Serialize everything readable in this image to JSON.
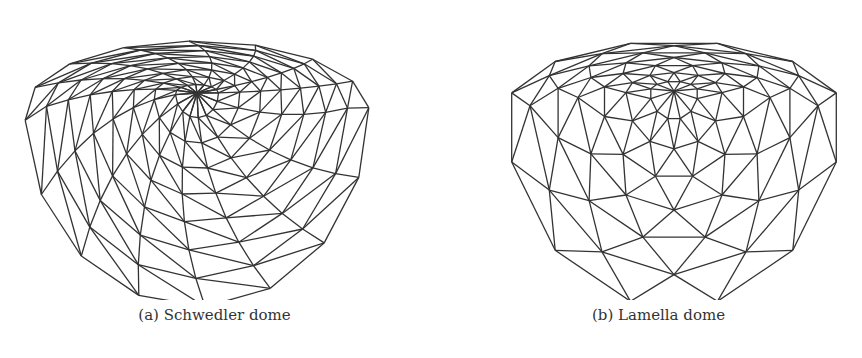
{
  "figures": [
    {
      "id": "a",
      "caption": "(a) Schwedler dome",
      "type": "schwedler",
      "center": [
        197,
        93
      ],
      "rings": 8,
      "segments": 16,
      "rx": 172,
      "ry_top": 70,
      "ry_bottom": 196,
      "twist": 0.055,
      "stroke": "#333333"
    },
    {
      "id": "b",
      "caption": "(b) Lamella dome",
      "type": "lamella",
      "center": [
        243,
        91
      ],
      "rings": 7,
      "segments": 12,
      "rx": 168,
      "ry_top": 70,
      "ry_bottom": 197,
      "stroke": "#333333"
    }
  ]
}
